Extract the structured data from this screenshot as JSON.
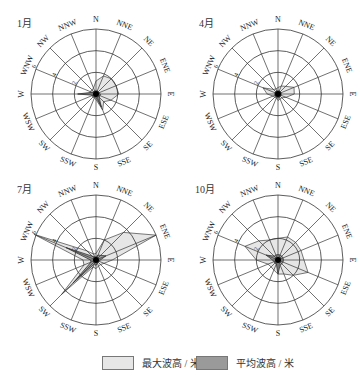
{
  "directions": [
    "N",
    "NNE",
    "NE",
    "ENE",
    "E",
    "ESE",
    "SE",
    "SSE",
    "S",
    "SSW",
    "SW",
    "WSW",
    "W",
    "WNW",
    "NW",
    "NNW"
  ],
  "ring_labels": [
    "2",
    "4",
    "6"
  ],
  "legend": {
    "max_label": "最大波高 / 米",
    "mean_label": "平均波高 / 米",
    "max_color": "#e6e6e6",
    "mean_color": "#9a9a9a"
  },
  "panels": [
    {
      "month": "1月",
      "cx": 96,
      "cy": 94
    },
    {
      "month": "4月",
      "cx": 278,
      "cy": 94
    },
    {
      "month": "7月",
      "cx": 93,
      "cy": 260
    },
    {
      "month": "10月",
      "cx": 277,
      "cy": 260
    }
  ],
  "chart_data": {
    "type": "radar",
    "title": "",
    "directions": [
      "N",
      "NNE",
      "NE",
      "ENE",
      "E",
      "ESE",
      "SE",
      "SSE",
      "S",
      "SSW",
      "SW",
      "WSW",
      "W",
      "WNW",
      "NW",
      "NNW"
    ],
    "radial_axis": {
      "ticks": [
        2,
        4,
        6
      ],
      "max": 6,
      "label_direction": "WNW"
    },
    "legend_position": "bottom",
    "charts": [
      {
        "month": "1月",
        "series": [
          {
            "name": "最大波高 / 米",
            "values": [
              1.2,
              1.8,
              2.0,
              2.0,
              2.1,
              1.5,
              1.0,
              1.6,
              0.5,
              0.4,
              0.4,
              0.4,
              0.5,
              0.6,
              0.5,
              0.6
            ]
          },
          {
            "name": "平均波高 / 米",
            "values": [
              0.3,
              0.3,
              0.3,
              0.3,
              0.4,
              0.4,
              0.4,
              1.3,
              0.3,
              0.3,
              0.3,
              0.3,
              1.7,
              0.4,
              0.3,
              0.3
            ]
          }
        ]
      },
      {
        "month": "4月",
        "series": [
          {
            "name": "最大波高 / 米",
            "values": [
              0.6,
              0.8,
              1.0,
              1.6,
              1.5,
              0.8,
              0.5,
              0.5,
              0.6,
              0.4,
              0.4,
              0.5,
              1.0,
              1.5,
              0.6,
              0.5
            ]
          },
          {
            "name": "平均波高 / 米",
            "values": [
              0.3,
              0.3,
              0.3,
              0.3,
              0.3,
              0.3,
              0.3,
              0.3,
              0.4,
              0.3,
              0.3,
              0.3,
              0.3,
              0.3,
              0.3,
              0.3
            ]
          }
        ]
      },
      {
        "month": "7月",
        "series": [
          {
            "name": "最大波高 / 米",
            "values": [
              0.6,
              2.0,
              3.6,
              6.0,
              1.5,
              0.8,
              0.6,
              0.6,
              0.8,
              0.7,
              4.5,
              1.2,
              1.2,
              6.2,
              1.2,
              0.6
            ]
          },
          {
            "name": "平均波高 / 米",
            "values": [
              0.3,
              0.5,
              0.6,
              1.0,
              0.4,
              0.3,
              0.3,
              0.3,
              0.5,
              0.4,
              3.0,
              0.5,
              0.5,
              3.0,
              0.5,
              0.3
            ]
          }
        ]
      },
      {
        "month": "10月",
        "series": [
          {
            "name": "最大波高 / 米",
            "values": [
              2.0,
              2.3,
              2.3,
              2.3,
              2.4,
              3.0,
              2.0,
              1.4,
              1.3,
              1.0,
              0.9,
              1.0,
              2.0,
              3.3,
              2.5,
              2.0
            ]
          },
          {
            "name": "平均波高 / 米",
            "values": [
              0.5,
              0.5,
              0.5,
              0.5,
              0.5,
              0.5,
              0.5,
              0.5,
              1.3,
              0.4,
              0.4,
              0.4,
              0.5,
              1.2,
              0.5,
              0.5
            ]
          }
        ]
      }
    ]
  }
}
